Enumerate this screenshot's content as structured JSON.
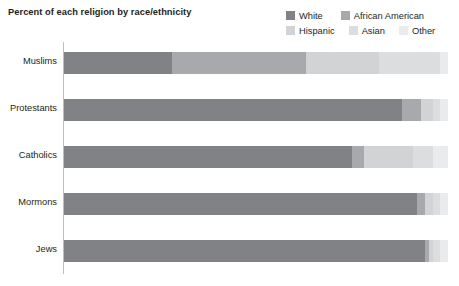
{
  "title": "Percent of each religion by race/ethnicity",
  "legend": {
    "position": "top-right",
    "entries": [
      {
        "label": "White",
        "key": "white",
        "color": "#808285"
      },
      {
        "label": "African American",
        "key": "african",
        "color": "#a7a9ac"
      },
      {
        "label": "Hispanic",
        "key": "hispanic",
        "color": "#d1d3d4"
      },
      {
        "label": "Asian",
        "key": "asian",
        "color": "#dcdddf"
      },
      {
        "label": "Other",
        "key": "other",
        "color": "#eaebec"
      }
    ]
  },
  "axis": {
    "categories": [
      "Muslims",
      "Protestants",
      "Catholics",
      "Mormons",
      "Jews"
    ],
    "value_axis_shown": false,
    "grid": false,
    "xlim": [
      0,
      100
    ]
  },
  "chart_data": {
    "type": "bar",
    "orientation": "horizontal",
    "stacked": true,
    "normalized": true,
    "title": "Percent of each religion by race/ethnicity",
    "xlabel": "",
    "ylabel": "",
    "xlim": [
      0,
      100
    ],
    "grid": false,
    "legend_position": "top-right",
    "categories": [
      "Muslims",
      "Protestants",
      "Catholics",
      "Mormons",
      "Jews"
    ],
    "series": [
      {
        "name": "White",
        "color": "#808285",
        "values": [
          28,
          88,
          75,
          92,
          94
        ]
      },
      {
        "name": "African American",
        "color": "#a7a9ac",
        "values": [
          35,
          5,
          3,
          2,
          1
        ]
      },
      {
        "name": "Hispanic",
        "color": "#d1d3d4",
        "values": [
          19,
          3,
          13,
          2,
          1
        ]
      },
      {
        "name": "Asian",
        "color": "#dcdddf",
        "values": [
          16,
          2,
          5,
          2,
          2
        ]
      },
      {
        "name": "Other",
        "color": "#eaebec",
        "values": [
          2,
          2,
          4,
          2,
          2
        ]
      }
    ],
    "bars": [
      {
        "category": "Muslims",
        "segments": [
          {
            "name": "White",
            "value": 28,
            "color": "#808285"
          },
          {
            "name": "African American",
            "value": 35,
            "color": "#a7a9ac"
          },
          {
            "name": "Hispanic",
            "value": 19,
            "color": "#d1d3d4"
          },
          {
            "name": "Asian",
            "value": 16,
            "color": "#dcdddf"
          },
          {
            "name": "Other",
            "value": 2,
            "color": "#eaebec"
          }
        ]
      },
      {
        "category": "Protestants",
        "segments": [
          {
            "name": "White",
            "value": 88,
            "color": "#808285"
          },
          {
            "name": "African American",
            "value": 5,
            "color": "#a7a9ac"
          },
          {
            "name": "Hispanic",
            "value": 3,
            "color": "#d1d3d4"
          },
          {
            "name": "Asian",
            "value": 2,
            "color": "#dcdddf"
          },
          {
            "name": "Other",
            "value": 2,
            "color": "#eaebec"
          }
        ]
      },
      {
        "category": "Catholics",
        "segments": [
          {
            "name": "White",
            "value": 75,
            "color": "#808285"
          },
          {
            "name": "African American",
            "value": 3,
            "color": "#a7a9ac"
          },
          {
            "name": "Hispanic",
            "value": 13,
            "color": "#d1d3d4"
          },
          {
            "name": "Asian",
            "value": 5,
            "color": "#dcdddf"
          },
          {
            "name": "Other",
            "value": 4,
            "color": "#eaebec"
          }
        ]
      },
      {
        "category": "Mormons",
        "segments": [
          {
            "name": "White",
            "value": 92,
            "color": "#808285"
          },
          {
            "name": "African American",
            "value": 2,
            "color": "#a7a9ac"
          },
          {
            "name": "Hispanic",
            "value": 2,
            "color": "#d1d3d4"
          },
          {
            "name": "Asian",
            "value": 2,
            "color": "#dcdddf"
          },
          {
            "name": "Other",
            "value": 2,
            "color": "#eaebec"
          }
        ]
      },
      {
        "category": "Jews",
        "segments": [
          {
            "name": "White",
            "value": 94,
            "color": "#808285"
          },
          {
            "name": "African American",
            "value": 1,
            "color": "#a7a9ac"
          },
          {
            "name": "Hispanic",
            "value": 1,
            "color": "#d1d3d4"
          },
          {
            "name": "Asian",
            "value": 2,
            "color": "#dcdddf"
          },
          {
            "name": "Other",
            "value": 2,
            "color": "#eaebec"
          }
        ]
      }
    ]
  },
  "colors": {
    "background": "#ffffff",
    "text": "#231f20",
    "axis_line": "#bcbec0"
  }
}
